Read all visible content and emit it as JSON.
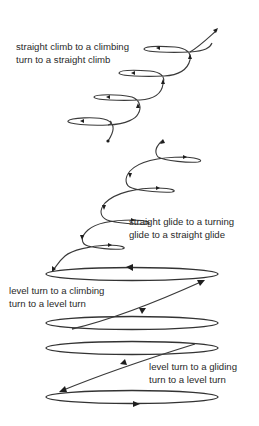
{
  "diagram": {
    "sections": [
      {
        "id": "climb",
        "label_lines": [
          "straight climb to a climbing",
          "turn to a straight climb"
        ]
      },
      {
        "id": "glide",
        "label_lines": [
          "straight glide to a turning",
          "glide to a straight glide"
        ]
      },
      {
        "id": "level-climb",
        "label_lines": [
          "level turn to a climbing",
          "turn to a level turn"
        ]
      },
      {
        "id": "level-glide",
        "label_lines": [
          "level turn to a gliding",
          "turn to a level turn"
        ]
      }
    ],
    "colors": {
      "line": "#3a3a3a",
      "text": "#2a2a2a",
      "background": "#ffffff"
    }
  }
}
